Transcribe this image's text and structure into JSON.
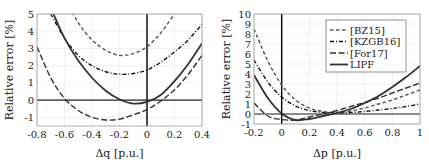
{
  "chart_data": [
    {
      "type": "line",
      "title": "",
      "xlabel": "Δq [p.u.]",
      "ylabel": "Relative error [%]",
      "xlim": [
        -0.8,
        0.4
      ],
      "ylim": [
        -1.5,
        5
      ],
      "xticks": [
        "-0.8",
        "-0.6",
        "-0.4",
        "-0.2",
        "0",
        "0.2",
        "0.4"
      ],
      "yticks": [
        "-1",
        "0",
        "1",
        "2",
        "3",
        "4",
        "5"
      ],
      "grid": true,
      "legend": null,
      "series": [
        {
          "name": "[BZ15]",
          "style": "dashed",
          "x": [
            -0.7,
            -0.6,
            -0.5,
            -0.4,
            -0.3,
            -0.2,
            -0.1,
            0,
            0.1,
            0.2
          ],
          "values": [
            8.0,
            6.0,
            4.5,
            3.5,
            2.9,
            2.6,
            2.7,
            3.1,
            3.9,
            5.0
          ]
        },
        {
          "name": "[KZGB16]",
          "style": "dashdot",
          "x": [
            -0.7,
            -0.6,
            -0.5,
            -0.4,
            -0.3,
            -0.2,
            -0.1,
            0,
            0.1,
            0.2,
            0.3,
            0.4
          ],
          "values": [
            5.0,
            3.6,
            2.6,
            2.0,
            1.65,
            1.5,
            1.55,
            1.75,
            2.2,
            2.8,
            3.5,
            4.4
          ]
        },
        {
          "name": "[For17]",
          "style": "longdash",
          "x": [
            -0.8,
            -0.7,
            -0.6,
            -0.5,
            -0.4,
            -0.3,
            -0.2,
            -0.1,
            0,
            0.1,
            0.2,
            0.3,
            0.4
          ],
          "values": [
            3.1,
            1.3,
            0.1,
            -0.6,
            -1.0,
            -1.15,
            -1.1,
            -0.85,
            -0.55,
            -0.05,
            0.6,
            1.5,
            2.6
          ]
        },
        {
          "name": "LIPF",
          "style": "solid",
          "x": [
            -0.68,
            -0.6,
            -0.5,
            -0.4,
            -0.3,
            -0.2,
            -0.1,
            0,
            0.1,
            0.2,
            0.3,
            0.4
          ],
          "values": [
            5.0,
            3.6,
            2.3,
            1.3,
            0.55,
            0.05,
            -0.2,
            -0.1,
            0.3,
            1.1,
            2.1,
            3.3
          ]
        }
      ]
    },
    {
      "type": "line",
      "title": "",
      "xlabel": "Δp [p.u.]",
      "ylabel": "Relative error [%]",
      "xlim": [
        -0.2,
        1
      ],
      "ylim": [
        -1,
        10
      ],
      "xticks": [
        "-0.2",
        "0",
        "0.2",
        "0.4",
        "0.6",
        "0.8",
        "1"
      ],
      "yticks": [
        "-1",
        "0",
        "1",
        "2",
        "3",
        "4",
        "5",
        "6",
        "7",
        "8",
        "9",
        "10"
      ],
      "grid": true,
      "legend": {
        "position": "upper right",
        "entries": [
          "[BZ15]",
          "[KZGB16]",
          "[For17]",
          "LIPF"
        ]
      },
      "series": [
        {
          "name": "[BZ15]",
          "style": "dashed",
          "x": [
            -0.2,
            -0.1,
            0,
            0.1,
            0.2,
            0.3,
            0.4,
            0.5,
            0.6,
            0.7,
            0.8,
            0.9,
            1.0
          ],
          "values": [
            8.5,
            5.3,
            2.9,
            1.4,
            0.6,
            0.25,
            0.15,
            0.3,
            0.6,
            1.0,
            1.4,
            1.9,
            2.4
          ]
        },
        {
          "name": "[KZGB16]",
          "style": "dashdot",
          "x": [
            -0.2,
            -0.1,
            0,
            0.1,
            0.2,
            0.3,
            0.4,
            0.5,
            0.6,
            0.7,
            0.8,
            0.9,
            1.0
          ],
          "values": [
            5.4,
            3.2,
            1.7,
            0.8,
            0.35,
            0.15,
            0.1,
            0.15,
            0.25,
            0.4,
            0.55,
            0.75,
            1.0
          ]
        },
        {
          "name": "[For17]",
          "style": "longdash",
          "x": [
            -0.2,
            -0.1,
            0,
            0.1,
            0.2,
            0.3,
            0.4,
            0.5,
            0.6,
            0.7,
            0.8,
            0.9,
            1.0
          ],
          "values": [
            1.1,
            -0.2,
            -0.55,
            -0.6,
            -0.3,
            0.0,
            0.35,
            0.75,
            1.15,
            1.6,
            2.1,
            2.6,
            3.1
          ]
        },
        {
          "name": "LIPF",
          "style": "solid",
          "x": [
            -0.2,
            -0.1,
            0,
            0.1,
            0.2,
            0.3,
            0.4,
            0.5,
            0.6,
            0.7,
            0.8,
            0.9,
            1.0
          ],
          "values": [
            3.9,
            1.6,
            0.05,
            -0.6,
            -0.5,
            -0.2,
            0.1,
            0.5,
            1.1,
            1.8,
            2.7,
            3.7,
            4.8
          ]
        }
      ]
    }
  ]
}
